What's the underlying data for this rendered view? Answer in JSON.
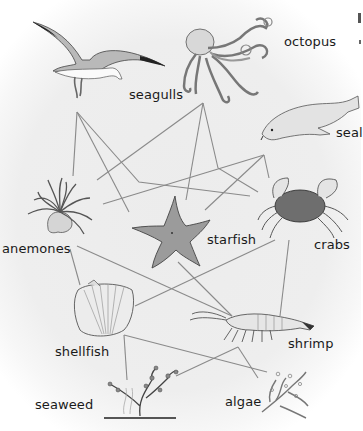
{
  "diagram": {
    "type": "food-web",
    "line_color": "#8a8a8a",
    "organisms": [
      {
        "id": "seagulls",
        "label": "seagulls",
        "icon": "seagull-icon"
      },
      {
        "id": "octopus",
        "label": "octopus",
        "icon": "octopus-icon"
      },
      {
        "id": "seal",
        "label": "seal",
        "icon": "seal-icon"
      },
      {
        "id": "anemones",
        "label": "anemones",
        "icon": "anemone-icon"
      },
      {
        "id": "starfish",
        "label": "starfish",
        "icon": "starfish-icon"
      },
      {
        "id": "crabs",
        "label": "crabs",
        "icon": "crab-icon"
      },
      {
        "id": "shellfish",
        "label": "shellfish",
        "icon": "shellfish-icon"
      },
      {
        "id": "shrimp",
        "label": "shrimp",
        "icon": "shrimp-icon"
      },
      {
        "id": "seaweed",
        "label": "seaweed",
        "icon": "seaweed-icon"
      },
      {
        "id": "algae",
        "label": "algae",
        "icon": "algae-icon"
      }
    ],
    "links": [
      {
        "from": "seagulls",
        "to": "anemones"
      },
      {
        "from": "seagulls",
        "to": "starfish"
      },
      {
        "from": "seagulls",
        "to": "crabs"
      },
      {
        "from": "octopus",
        "to": "anemones"
      },
      {
        "from": "octopus",
        "to": "starfish"
      },
      {
        "from": "octopus",
        "to": "crabs"
      },
      {
        "from": "seal",
        "to": "anemones"
      },
      {
        "from": "seal",
        "to": "starfish"
      },
      {
        "from": "seal",
        "to": "crabs"
      },
      {
        "from": "anemones",
        "to": "shellfish"
      },
      {
        "from": "anemones",
        "to": "shrimp"
      },
      {
        "from": "starfish",
        "to": "shrimp"
      },
      {
        "from": "crabs",
        "to": "shellfish"
      },
      {
        "from": "crabs",
        "to": "shrimp"
      },
      {
        "from": "shellfish",
        "to": "seaweed"
      },
      {
        "from": "shellfish",
        "to": "algae"
      },
      {
        "from": "shrimp",
        "to": "seaweed"
      },
      {
        "from": "shrimp",
        "to": "algae"
      }
    ]
  }
}
